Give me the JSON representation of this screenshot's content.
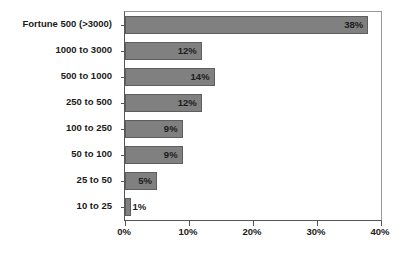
{
  "chart_data": {
    "type": "bar",
    "orientation": "horizontal",
    "title": "",
    "subtitle": "",
    "xlabel": "",
    "ylabel": "",
    "xlim": [
      0,
      40
    ],
    "xticks": [
      0,
      10,
      20,
      30,
      40
    ],
    "xtick_labels": [
      "0%",
      "10%",
      "20%",
      "30%",
      "40%"
    ],
    "grid": false,
    "legend": null,
    "bar_color": "#808080",
    "bar_border_color": "#5e5e5e",
    "categories": [
      "Fortune 500 (>3000)",
      "1000 to 3000",
      "500 to 1000",
      "250 to 500",
      "100 to 250",
      "50 to 100",
      "25 to 50",
      "10 to 25"
    ],
    "values": [
      38,
      12,
      14,
      12,
      9,
      9,
      5,
      1
    ],
    "value_labels": [
      "38%",
      "12%",
      "14%",
      "12%",
      "9%",
      "9%",
      "5%",
      "1%"
    ],
    "label_placement": [
      "inside",
      "inside",
      "inside",
      "inside",
      "inside",
      "inside",
      "inside",
      "outside"
    ]
  }
}
